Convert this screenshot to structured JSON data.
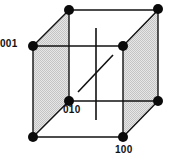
{
  "diagram": {
    "type": "cube-lattice",
    "colors": {
      "line": "#111111",
      "vertex": "#0a0a0a",
      "face_shade": "#d4d4d4",
      "background": "#ffffff"
    },
    "vertices": {
      "back_top_left": [
        69,
        10
      ],
      "back_top_right": [
        158,
        10
      ],
      "front_top_left": [
        33,
        46
      ],
      "front_top_right": [
        123,
        46
      ],
      "back_bottom_left": [
        69,
        101
      ],
      "back_bottom_right": [
        158,
        101
      ],
      "front_bottom_left": [
        33,
        137
      ],
      "front_bottom_right": [
        123,
        137
      ]
    },
    "labels": {
      "v001": "001",
      "v010": "010",
      "v100": "100"
    },
    "shaded_faces": [
      "left",
      "right"
    ],
    "center_lines": {
      "vertical": [
        [
          96,
          28
        ],
        [
          96,
          120
        ]
      ],
      "diagonal": [
        [
          78,
          92
        ],
        [
          113,
          55
        ]
      ]
    }
  }
}
